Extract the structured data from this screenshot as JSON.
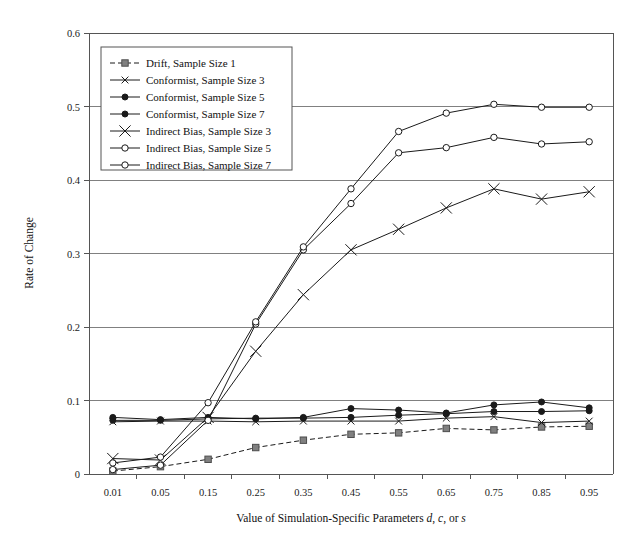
{
  "chart_data": {
    "type": "line",
    "title": "",
    "xlabel": "Value of Simulation-Specific Parameters d, c, or s",
    "ylabel": "Rate of Change",
    "categories": [
      "0.01",
      "0.05",
      "0.15",
      "0.25",
      "0.35",
      "0.45",
      "0.55",
      "0.65",
      "0.75",
      "0.85",
      "0.95"
    ],
    "xtick_labels": [
      "0.01",
      "0.05",
      "0.15",
      "0.25",
      "0.35",
      "0.45",
      "0.55",
      "0.65",
      "0.75",
      "0.85",
      "0.95"
    ],
    "ytick_labels": [
      "0",
      "0.1",
      "0.2",
      "0.3",
      "0.4",
      "0.5",
      "0.6"
    ],
    "ytick_values": [
      0,
      0.1,
      0.2,
      0.3,
      0.4,
      0.5,
      0.6
    ],
    "ylim": [
      0,
      0.6
    ],
    "grid": "horizontal",
    "legend_position": "upper-left-inside",
    "series": [
      {
        "name": "Drift, Sample Size 1",
        "marker": "square-filled-gray",
        "line_style": "dashed",
        "values": [
          0.004,
          0.01,
          0.02,
          0.036,
          0.046,
          0.054,
          0.056,
          0.062,
          0.06,
          0.064,
          0.065
        ]
      },
      {
        "name": "Conformist, Sample Size 3",
        "marker": "x-small",
        "line_style": "solid",
        "values": [
          0.071,
          0.072,
          0.072,
          0.071,
          0.072,
          0.072,
          0.072,
          0.076,
          0.078,
          0.07,
          0.072
        ]
      },
      {
        "name": "Conformist, Sample Size 5",
        "marker": "circle-filled",
        "line_style": "solid",
        "values": [
          0.073,
          0.073,
          0.075,
          0.076,
          0.076,
          0.077,
          0.08,
          0.082,
          0.085,
          0.085,
          0.086
        ]
      },
      {
        "name": "Conformist, Sample Size 7",
        "marker": "circle-filled",
        "line_style": "solid",
        "values": [
          0.077,
          0.074,
          0.077,
          0.075,
          0.077,
          0.089,
          0.087,
          0.083,
          0.094,
          0.098,
          0.09
        ]
      },
      {
        "name": "Indirect Bias, Sample Size 3",
        "marker": "x-large",
        "line_style": "solid",
        "values": [
          0.021,
          0.019,
          0.077,
          0.167,
          0.244,
          0.305,
          0.333,
          0.362,
          0.388,
          0.374,
          0.384
        ]
      },
      {
        "name": "Indirect Bias, Sample Size 5",
        "marker": "circle-hollow",
        "line_style": "solid",
        "values": [
          0.006,
          0.012,
          0.073,
          0.204,
          0.305,
          0.368,
          0.437,
          0.444,
          0.458,
          0.449,
          0.452
        ]
      },
      {
        "name": "Indirect Bias, Sample Size 7",
        "marker": "circle-hollow",
        "line_style": "solid",
        "values": [
          0.015,
          0.023,
          0.097,
          0.207,
          0.309,
          0.388,
          0.466,
          0.491,
          0.503,
          0.499,
          0.499
        ]
      }
    ]
  },
  "legend": {
    "entries": [
      "Drift, Sample Size 1",
      "Conformist, Sample Size 3",
      "Conformist, Sample Size 5",
      "Conformist, Sample Size 7",
      "Indirect Bias, Sample Size 3",
      "Indirect Bias, Sample Size 5",
      "Indirect Bias, Sample Size 7"
    ]
  },
  "axes": {
    "y_title": "Rate of Change",
    "x_title_parts": {
      "lead": "Value of Simulation-Specific Parameters ",
      "italic_d": "d",
      "sep1": ", ",
      "italic_c": "c",
      "sep2": ", or ",
      "italic_s": "s"
    }
  },
  "colors": {
    "ink": "#1a1a1a",
    "grid": "#808080",
    "axis": "#555555",
    "drift_marker": "#808080",
    "background": "#ffffff"
  }
}
